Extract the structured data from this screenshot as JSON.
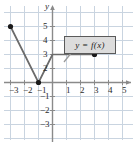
{
  "figure": {
    "kind": "coordinate-plane-graph",
    "axis_names": {
      "x": "x",
      "y": "y"
    },
    "callout_label": "y = f(x)",
    "colors": {
      "grid": "#c9d4e0",
      "axis": "#8a8a8a",
      "curve": "#6b6b6b",
      "point": "#1a1a1a",
      "callout_fill": "#dcdcdc",
      "callout_border": "#5a5a5a",
      "text": "#2b2b2b"
    }
  },
  "chart_data": {
    "type": "line",
    "title": "",
    "xlabel": "x",
    "ylabel": "y",
    "xlim": [
      -3.6,
      5.9
    ],
    "ylim": [
      -3.6,
      5.6
    ],
    "grid": true,
    "legend": "y = f(x)",
    "x_ticks": [
      -3,
      -2,
      -1,
      1,
      2,
      3,
      4,
      5
    ],
    "x_tick_labels": [
      "-3",
      "-2",
      "-1",
      "1",
      "2",
      "3",
      "4",
      "5"
    ],
    "y_ticks": [
      5,
      4,
      3,
      2,
      -1,
      -2,
      -3
    ],
    "y_tick_labels": [
      "5",
      "4",
      "3",
      "2",
      "-1",
      "-2",
      "-3"
    ],
    "series": [
      {
        "name": "y = f(x)",
        "points": [
          {
            "x": -3,
            "y": 4
          },
          {
            "x": -1,
            "y": 0
          },
          {
            "x": 0,
            "y": 2
          },
          {
            "x": 3,
            "y": 2
          }
        ]
      }
    ],
    "closed_points": [
      {
        "x": -3,
        "y": 4
      },
      {
        "x": -1,
        "y": 0
      },
      {
        "x": 3,
        "y": 2
      }
    ],
    "annotations": [
      {
        "text": "y = f(x)",
        "x": 1.3,
        "y": 3.3
      }
    ]
  },
  "x_labels": [
    {
      "text": "-3",
      "left": 9,
      "top": 86
    },
    {
      "text": "-2",
      "left": 23,
      "top": 86
    },
    {
      "text": "-1",
      "left": 37,
      "top": 86
    },
    {
      "text": "1",
      "left": 66,
      "top": 86
    },
    {
      "text": "2",
      "left": 80,
      "top": 86
    },
    {
      "text": "3",
      "left": 94,
      "top": 86
    },
    {
      "text": "4",
      "left": 108,
      "top": 86
    },
    {
      "text": "5",
      "left": 122,
      "top": 86
    }
  ],
  "y_labels": [
    {
      "text": "5",
      "left": 43,
      "top": 22
    },
    {
      "text": "4",
      "left": 43,
      "top": 36
    },
    {
      "text": "3",
      "left": 43,
      "top": 50
    },
    {
      "text": "2",
      "left": 43,
      "top": 64
    },
    {
      "text": "-1",
      "left": 40,
      "top": 92
    },
    {
      "text": "-2",
      "left": 40,
      "top": 106
    },
    {
      "text": "-3",
      "left": 40,
      "top": 120
    }
  ],
  "axis_label_positions": {
    "y": {
      "left": 45,
      "top": 2
    },
    "x": {
      "left": 130,
      "top": 76
    }
  }
}
